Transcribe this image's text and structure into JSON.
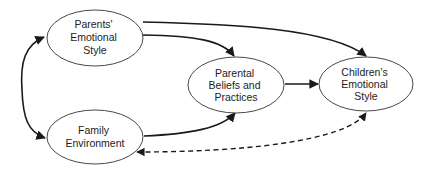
{
  "diagram": {
    "type": "path-model",
    "nodes": [
      {
        "id": "parents",
        "lines": [
          "Parents'",
          "Emotional",
          "Style"
        ],
        "cx": 95,
        "cy": 38,
        "rx": 48,
        "ry": 28
      },
      {
        "id": "family",
        "lines": [
          "Family",
          "Environment"
        ],
        "cx": 95,
        "cy": 137,
        "rx": 48,
        "ry": 27
      },
      {
        "id": "beliefs",
        "lines": [
          "Parental",
          "Beliefs and",
          "Practices"
        ],
        "cx": 236,
        "cy": 85,
        "rx": 48,
        "ry": 28
      },
      {
        "id": "children",
        "lines": [
          "Children's",
          "Emotional",
          "Style"
        ],
        "cx": 366,
        "cy": 84,
        "rx": 47,
        "ry": 27
      }
    ],
    "edges": [
      {
        "from": "parents",
        "to": "family",
        "style": "solid",
        "direction": "bidirectional"
      },
      {
        "from": "parents",
        "to": "beliefs",
        "style": "solid",
        "direction": "forward"
      },
      {
        "from": "parents",
        "to": "children",
        "style": "solid",
        "direction": "forward"
      },
      {
        "from": "family",
        "to": "beliefs",
        "style": "solid",
        "direction": "forward"
      },
      {
        "from": "beliefs",
        "to": "children",
        "style": "solid",
        "direction": "forward"
      },
      {
        "from": "family",
        "to": "children",
        "style": "dashed",
        "direction": "bidirectional"
      }
    ]
  },
  "labels": {
    "parents": [
      "Parents'",
      "Emotional",
      "Style"
    ],
    "family": [
      "Family",
      "Environment"
    ],
    "beliefs": [
      "Parental",
      "Beliefs and",
      "Practices"
    ],
    "children": [
      "Children's",
      "Emotional",
      "Style"
    ]
  }
}
